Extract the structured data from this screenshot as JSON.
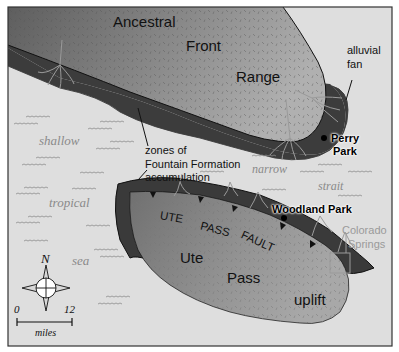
{
  "map": {
    "title": "Ancestral Front Range paleogeography",
    "colors": {
      "background_border": "#ffffff",
      "sea": "#dcdcdc",
      "range_dark": "#6a6a6a",
      "range_light": "#a4a4a4",
      "fountain_band": "#3a3a3a",
      "ute_pass_uplift": "#8c8c8c",
      "fan_lines": "#9c9c9c",
      "waves": "#8e8e8e",
      "frame": "#333333"
    },
    "landforms": {
      "ancestral": "Ancestral",
      "front": "Front",
      "range": "Range",
      "ute": "Ute",
      "pass": "Pass",
      "uplift": "uplift"
    },
    "fault": {
      "words": [
        "UTE",
        "PASS",
        "FAULT"
      ]
    },
    "annotations": {
      "alluvial_fan": [
        "alluvial",
        "fan"
      ],
      "zones": [
        "zones of",
        "Fountain Formation",
        "accumulation"
      ]
    },
    "places": {
      "perry_park": [
        "Perry",
        "Park"
      ],
      "woodland_park": "Woodland Park",
      "colorado_springs": [
        "Colorado",
        "Springs"
      ]
    },
    "sea_words": {
      "shallow": "shallow",
      "tropical": "tropical",
      "sea": "sea",
      "narrow": "narrow",
      "strait": "strait"
    },
    "compass": {
      "north_label": "N"
    },
    "scale_bar": {
      "min": "0",
      "max": "12",
      "unit": "miles"
    }
  }
}
